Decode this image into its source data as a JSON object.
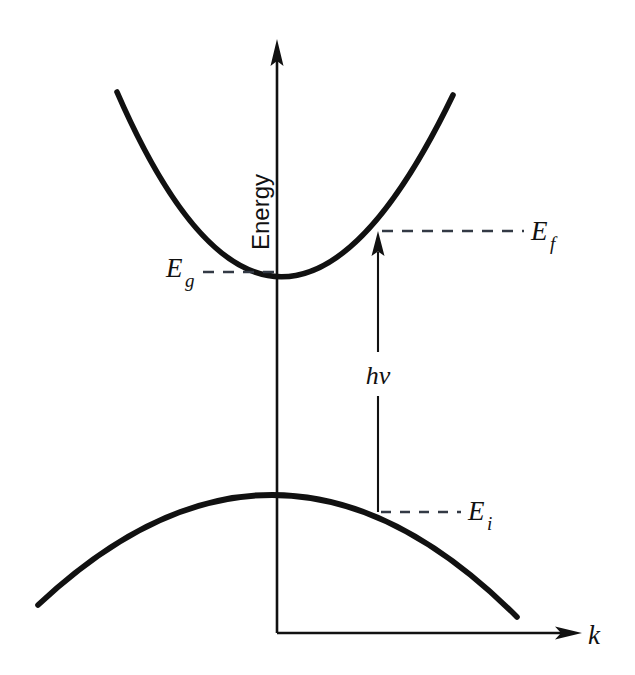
{
  "figure": {
    "kind": "band-structure-diagram",
    "background_color": "#ffffff",
    "ink_color": "#111111",
    "width": 635,
    "height": 675
  },
  "axes": {
    "vertical": {
      "name": "Energy",
      "arrow": "up",
      "x": 277,
      "top_y": 42,
      "bottom_y": 633
    },
    "horizontal": {
      "name": "k",
      "arrow": "right",
      "y": 633,
      "left_x": 277,
      "right_x": 580
    }
  },
  "bands": [
    {
      "role": "conduction-band",
      "shape": "upward-parabola",
      "vertex": {
        "x": 277,
        "y": 272
      },
      "left_end": {
        "x": 117,
        "y": 92
      },
      "right_end": {
        "x": 453,
        "y": 95
      }
    },
    {
      "role": "valence-band",
      "shape": "downward-parabola",
      "vertex": {
        "x": 277,
        "y": 494
      },
      "left_end": {
        "x": 38,
        "y": 605
      },
      "right_end": {
        "x": 517,
        "y": 617
      }
    }
  ],
  "labels": {
    "band_gap": {
      "base": "E",
      "sub": "g",
      "x": 168,
      "y": 277,
      "side": "left"
    },
    "final_state": {
      "base": "E",
      "sub": "f",
      "x": 533,
      "y": 238,
      "side": "right"
    },
    "initial_state": {
      "base": "E",
      "sub": "i",
      "x": 470,
      "y": 517,
      "side": "right"
    },
    "photon_energy": {
      "text": "hv",
      "x": 363,
      "y": 380
    }
  },
  "leader_lines": [
    {
      "for": "band_gap",
      "from_x": 203,
      "to_x": 281,
      "y": 272,
      "style": "dashed"
    },
    {
      "for": "final_state",
      "from_x": 382,
      "to_x": 524,
      "y": 231,
      "style": "dashed"
    },
    {
      "for": "initial_state",
      "from_x": 381,
      "to_x": 461,
      "y": 512,
      "style": "dashed"
    }
  ],
  "transition_arrow": {
    "label": "hv",
    "x": 378,
    "from_y": 512,
    "to_y": 234,
    "direction": "up",
    "gap_top_y": 352,
    "gap_bottom_y": 396
  }
}
